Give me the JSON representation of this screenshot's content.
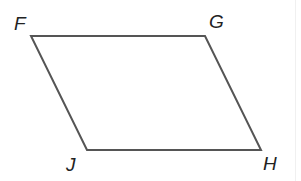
{
  "figure": {
    "type": "parallelogram",
    "vertices": [
      {
        "label": "F",
        "x": 31,
        "y": 36,
        "label_x": 14,
        "label_y": 14
      },
      {
        "label": "G",
        "x": 205,
        "y": 36,
        "label_x": 209,
        "label_y": 12
      },
      {
        "label": "H",
        "x": 261,
        "y": 150,
        "label_x": 263,
        "label_y": 154
      },
      {
        "label": "J",
        "x": 87,
        "y": 150,
        "label_x": 66,
        "label_y": 155
      }
    ],
    "stroke_color": "#555555"
  }
}
